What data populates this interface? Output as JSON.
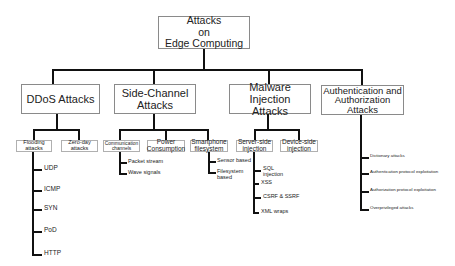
{
  "root": {
    "label_line1": "Attacks",
    "label_line2": "on",
    "label_line3": "Edge Computing"
  },
  "categories": [
    {
      "label": "DDoS Attacks",
      "children": [
        {
          "label_line1": "Flooding",
          "label_line2": "attacks",
          "leaves": [
            "UDP",
            "ICMP",
            "SYN",
            "PoD",
            "HTTP"
          ]
        },
        {
          "label_line1": "Zero-day",
          "label_line2": "attacks",
          "leaves": []
        }
      ]
    },
    {
      "label_line1": "Side-Channel",
      "label_line2": "Attacks",
      "children": [
        {
          "label_line1": "Communication",
          "label_line2": "channels",
          "leaves": [
            "Packet stream",
            "Wave signals"
          ]
        },
        {
          "label_line1": "Power",
          "label_line2": "Consumption",
          "leaves": []
        },
        {
          "label_line1": "Smartphone",
          "label_line2": "filesystem",
          "leaves": [
            {
              "line1": "Sensor based"
            },
            {
              "line1": "Filesystem",
              "line2": "based"
            }
          ]
        }
      ]
    },
    {
      "label_line1": "Malware Injection",
      "label_line2": "Attacks",
      "children": [
        {
          "label_line1": "Server-side",
          "label_line2": "injection",
          "leaves": [
            {
              "line1": "SQL",
              "line2": "injection"
            },
            {
              "line1": "XSS"
            },
            {
              "line1": "CSRF & SSRF"
            },
            {
              "line1": "XML wraps"
            }
          ]
        },
        {
          "label_line1": "Device-side",
          "label_line2": "injection",
          "leaves": []
        }
      ]
    },
    {
      "label_line1": "Authentication and",
      "label_line2": "Authorization",
      "label_line3": "Attacks",
      "leaves": [
        "Dictionary attacks",
        "Authentication protocol exploitation",
        "Authorization protocol exploitation",
        "Overprivileged attacks"
      ]
    }
  ]
}
